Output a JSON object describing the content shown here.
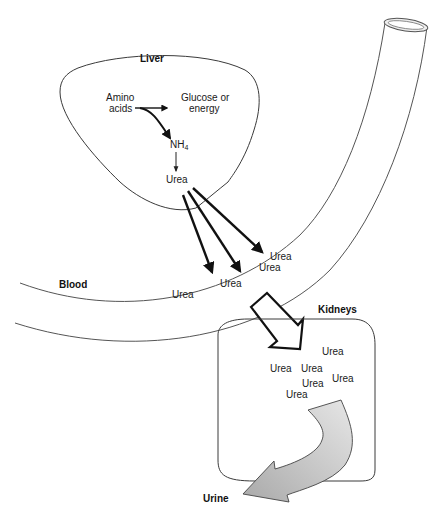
{
  "diagram": {
    "labels": {
      "liver": "Liver",
      "amino_acids_line1": "Amino",
      "amino_acids_line2": "acids",
      "glucose_line1": "Glucose or",
      "glucose_line2": "energy",
      "nh4": "NH",
      "nh4_sub": "4",
      "urea_liver": "Urea",
      "blood": "Blood",
      "kidneys": "Kidneys",
      "urine": "Urine"
    },
    "blood_urea": [
      {
        "text": "Urea",
        "x": 248,
        "y": 271
      },
      {
        "text": "Urea",
        "x": 220,
        "y": 285
      },
      {
        "text": "Urea",
        "x": 258,
        "y": 291
      },
      {
        "text": "Urea",
        "x": 172,
        "y": 298
      }
    ],
    "kidney_urea": [
      {
        "text": "Urea",
        "x": 322,
        "y": 355
      },
      {
        "text": "Urea",
        "x": 270,
        "y": 371
      },
      {
        "text": "Urea",
        "x": 301,
        "y": 371
      },
      {
        "text": "Urea",
        "x": 332,
        "y": 382
      },
      {
        "text": "Urea",
        "x": 302,
        "y": 387
      },
      {
        "text": "Urea",
        "x": 286,
        "y": 398
      }
    ],
    "colors": {
      "line": "#3a3a3a",
      "arrow": "#111111",
      "urine_arrow_fill": "#c8c8c8",
      "background": "#ffffff"
    }
  }
}
